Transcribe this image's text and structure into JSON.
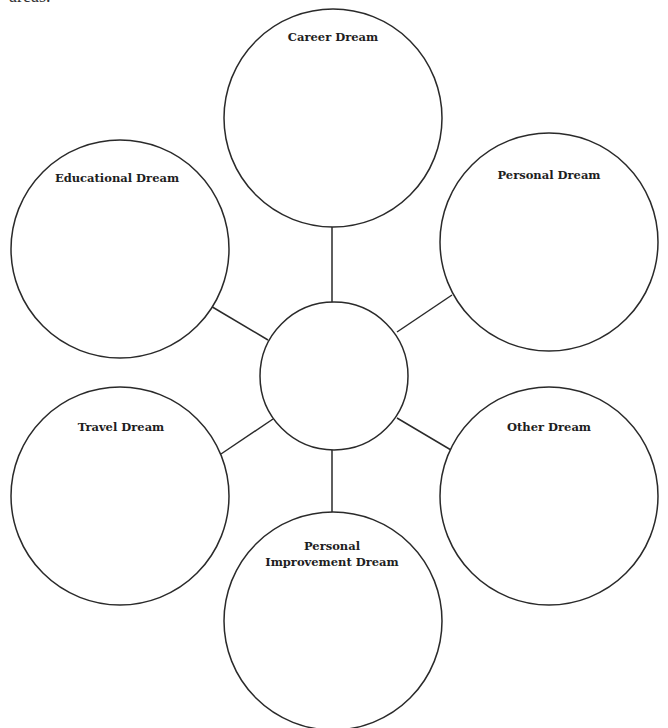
{
  "page": {
    "top_fragment_text": "areas."
  },
  "diagram": {
    "type": "bubble-map",
    "stroke_color": "#2a2a2a",
    "center": {
      "label": "",
      "cx": 334,
      "cy": 376,
      "r": 74
    },
    "bubbles": [
      {
        "id": "career",
        "label": "Career Dream",
        "cx": 333,
        "cy": 118,
        "r": 109
      },
      {
        "id": "educational",
        "label": "Educational Dream",
        "cx": 120,
        "cy": 249,
        "r": 109
      },
      {
        "id": "personal",
        "label": "Personal Dream",
        "cx": 549,
        "cy": 242,
        "r": 109
      },
      {
        "id": "travel",
        "label": "Travel Dream",
        "cx": 120,
        "cy": 496,
        "r": 109
      },
      {
        "id": "other",
        "label": "Other Dream",
        "cx": 549,
        "cy": 496,
        "r": 109
      },
      {
        "id": "personal-improvement",
        "label_line1": "Personal",
        "label_line2": "Improvement Dream",
        "cx": 333,
        "cy": 621,
        "r": 109
      }
    ],
    "connectors": [
      {
        "to": "career",
        "x1": 332,
        "y1": 227,
        "x2": 332,
        "y2": 302
      },
      {
        "to": "educational",
        "x1": 209,
        "y1": 305,
        "x2": 268,
        "y2": 340
      },
      {
        "to": "personal",
        "x1": 452,
        "y1": 295,
        "x2": 397,
        "y2": 332
      },
      {
        "to": "travel",
        "x1": 221,
        "y1": 454,
        "x2": 273,
        "y2": 419
      },
      {
        "to": "other",
        "x1": 451,
        "y1": 450,
        "x2": 397,
        "y2": 418
      },
      {
        "to": "personal-improvement",
        "x1": 332,
        "y1": 450,
        "x2": 332,
        "y2": 512
      }
    ]
  }
}
